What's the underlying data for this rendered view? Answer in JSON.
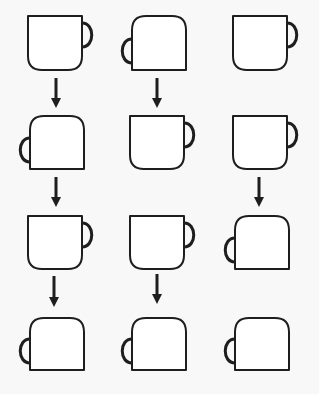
{
  "figure": {
    "colors": {
      "background": "#f8f8f8",
      "stroke": "#1e1e1e",
      "fill": "#ffffff"
    },
    "columns": [
      {
        "index": 1,
        "cx": 55
      },
      {
        "index": 2,
        "cx": 157
      },
      {
        "index": 3,
        "cx": 260
      }
    ],
    "rows": [
      {
        "index": 1,
        "top": 16,
        "bottom": 70,
        "cups": [
          "upright",
          "flipped",
          "upright"
        ]
      },
      {
        "index": 2,
        "top": 116,
        "bottom": 169,
        "cups": [
          "flipped",
          "upright",
          "upright"
        ]
      },
      {
        "index": 3,
        "top": 216,
        "bottom": 269,
        "cups": [
          "upright",
          "upright",
          "flipped"
        ]
      },
      {
        "index": 4,
        "top": 318,
        "bottom": 370,
        "cups": [
          "flipped",
          "flipped",
          "flipped"
        ]
      }
    ],
    "arrows": [
      {
        "from_row": 1,
        "to_row": 2,
        "col": 1,
        "x": 56,
        "y1": 78,
        "y2": 108
      },
      {
        "from_row": 1,
        "to_row": 2,
        "col": 2,
        "x": 157,
        "y1": 78,
        "y2": 108
      },
      {
        "from_row": 2,
        "to_row": 3,
        "col": 1,
        "x": 56,
        "y1": 177,
        "y2": 207
      },
      {
        "from_row": 2,
        "to_row": 3,
        "col": 3,
        "x": 259,
        "y1": 177,
        "y2": 207
      },
      {
        "from_row": 3,
        "to_row": 4,
        "col": 1,
        "x": 54,
        "y1": 276,
        "y2": 307
      },
      {
        "from_row": 3,
        "to_row": 4,
        "col": 2,
        "x": 157,
        "y1": 274,
        "y2": 304
      }
    ],
    "icons": {
      "upright": "mug-upright-icon",
      "flipped": "mug-upside-down-icon",
      "arrow": "arrow-down-icon"
    }
  }
}
